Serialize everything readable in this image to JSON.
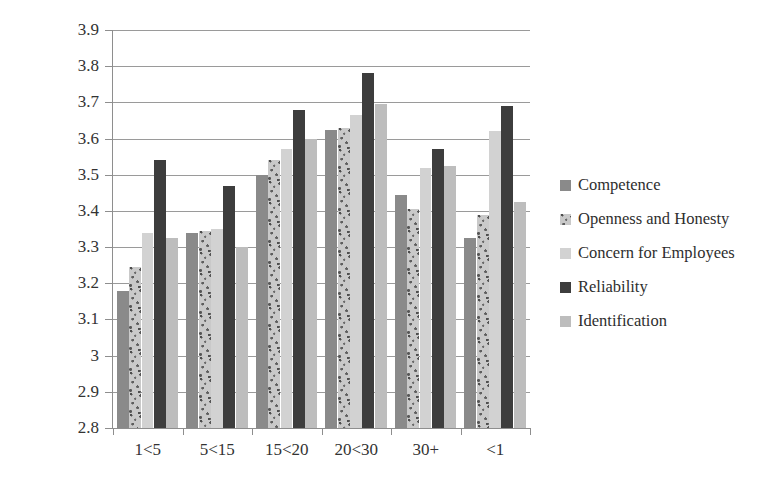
{
  "chart_data": {
    "type": "bar",
    "title": "",
    "xlabel": "",
    "ylabel": "",
    "ylim": [
      2.8,
      3.9
    ],
    "grid": true,
    "legend_position": "right",
    "categories": [
      "1<5",
      "5<15",
      "15<20",
      "20<30",
      "30+",
      "<1"
    ],
    "ytick_labels": [
      "3.9",
      "3.8",
      "3.7",
      "3.6",
      "3.5",
      "3.4",
      "3.3",
      "3.2",
      "3.1",
      "3",
      "2.9",
      "2.8"
    ],
    "ytick_values": [
      3.9,
      3.8,
      3.7,
      3.6,
      3.5,
      3.4,
      3.3,
      3.2,
      3.1,
      3.0,
      2.9,
      2.8
    ],
    "series": [
      {
        "name": "Competence",
        "color": "#8a8a8a",
        "values": [
          3.18,
          3.34,
          3.5,
          3.625,
          3.445,
          3.325
        ]
      },
      {
        "name": "Openness and Honesty",
        "color": "#c9c9c9",
        "values": [
          3.245,
          3.345,
          3.54,
          3.63,
          3.405,
          3.39
        ]
      },
      {
        "name": "Concern for Employees",
        "color": "#d2d2d2",
        "values": [
          3.34,
          3.35,
          3.57,
          3.665,
          3.52,
          3.62
        ]
      },
      {
        "name": "Reliability",
        "color": "#3d3d3d",
        "values": [
          3.54,
          3.47,
          3.68,
          3.78,
          3.57,
          3.69
        ]
      },
      {
        "name": "Identification",
        "color": "#bdbdbd",
        "values": [
          3.325,
          3.3,
          3.6,
          3.695,
          3.525,
          3.425
        ]
      }
    ]
  },
  "legend": {
    "items": [
      {
        "label": "Competence",
        "swatch": "#8a8a8a"
      },
      {
        "label": "Openness and Honesty",
        "swatch": "#c9c9c9"
      },
      {
        "label": "Concern for Employees",
        "swatch": "#d2d2d2"
      },
      {
        "label": "Reliability",
        "swatch": "#3d3d3d"
      },
      {
        "label": "Identification",
        "swatch": "#bdbdbd"
      }
    ]
  }
}
